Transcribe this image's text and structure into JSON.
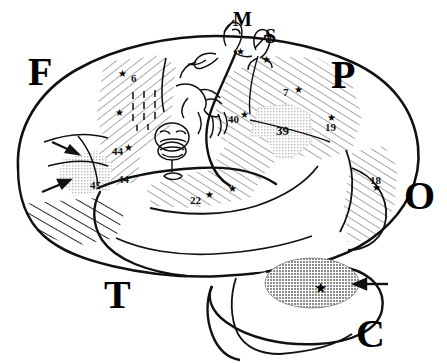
{
  "figure": {
    "kind": "brain-lateral-view-diagram"
  },
  "lobe_labels": [
    {
      "id": "frontal",
      "text": "F",
      "x": 28,
      "y": 52,
      "size": "big"
    },
    {
      "id": "parietal",
      "text": "P",
      "x": 331,
      "y": 55,
      "size": "big"
    },
    {
      "id": "occipital",
      "text": "O",
      "x": 404,
      "y": 176,
      "size": "big"
    },
    {
      "id": "temporal",
      "text": "T",
      "x": 104,
      "y": 275,
      "size": "big"
    },
    {
      "id": "cerebellum",
      "text": "C",
      "x": 356,
      "y": 314,
      "size": "big"
    },
    {
      "id": "motor",
      "text": "M",
      "x": 233,
      "y": 9,
      "size": "mid"
    },
    {
      "id": "sensory",
      "text": "S",
      "x": 265,
      "y": 26,
      "size": "mid"
    }
  ],
  "brodmann_areas": [
    {
      "id": "area-6",
      "label": "6",
      "x": 131,
      "y": 73,
      "big": false
    },
    {
      "id": "area-7",
      "label": "7",
      "x": 283,
      "y": 87,
      "big": false
    },
    {
      "id": "area-40",
      "label": "40",
      "x": 228,
      "y": 114,
      "big": false
    },
    {
      "id": "area-39",
      "label": "39",
      "x": 276,
      "y": 124,
      "big": true
    },
    {
      "id": "area-19",
      "label": "19",
      "x": 325,
      "y": 122,
      "big": false
    },
    {
      "id": "area-18",
      "label": "18",
      "x": 370,
      "y": 175,
      "big": false
    },
    {
      "id": "area-44",
      "label": "44",
      "x": 112,
      "y": 146,
      "big": false
    },
    {
      "id": "area-44b",
      "label": "44",
      "x": 118,
      "y": 174,
      "big": false
    },
    {
      "id": "area-45",
      "label": "45",
      "x": 90,
      "y": 180,
      "big": false
    },
    {
      "id": "area-22",
      "label": "22",
      "x": 190,
      "y": 195,
      "big": false
    }
  ],
  "stars": [
    {
      "id": "star-area-6-upper",
      "x": 118,
      "y": 69,
      "size": "sm"
    },
    {
      "id": "star-area-6-lower",
      "x": 115,
      "y": 108,
      "size": "sm"
    },
    {
      "id": "star-area-44",
      "x": 124,
      "y": 143,
      "size": "sm"
    },
    {
      "id": "star-area-22-left",
      "x": 205,
      "y": 190,
      "size": "sm"
    },
    {
      "id": "star-area-22-right",
      "x": 228,
      "y": 184,
      "size": "sm"
    },
    {
      "id": "star-area-40",
      "x": 240,
      "y": 110,
      "size": "sm"
    },
    {
      "id": "star-area-7",
      "x": 294,
      "y": 85,
      "size": "sm"
    },
    {
      "id": "star-area-19",
      "x": 327,
      "y": 113,
      "size": "sm"
    },
    {
      "id": "star-area-18",
      "x": 372,
      "y": 183,
      "size": "sm"
    },
    {
      "id": "star-cerebellum",
      "x": 314,
      "y": 281,
      "size": "lg"
    },
    {
      "id": "star-motor-top",
      "x": 236,
      "y": 47,
      "size": "sm"
    },
    {
      "id": "star-sensory-top",
      "x": 262,
      "y": 55,
      "size": "sm"
    }
  ],
  "shaded_regions": [
    {
      "id": "premotor-area-6",
      "pattern": "hatch-right",
      "label": "6"
    },
    {
      "id": "parietal-areas-7-40-19",
      "pattern": "hatch-left",
      "label": "7/40/19"
    },
    {
      "id": "angular-gyrus-area-39",
      "pattern": "stipple-light",
      "label": "39"
    },
    {
      "id": "superior-temporal-22",
      "pattern": "hatch-left",
      "label": "22"
    },
    {
      "id": "broca-area-44",
      "pattern": "hatch-right",
      "label": "44"
    },
    {
      "id": "area-45-region",
      "pattern": "stipple-light",
      "label": "45"
    },
    {
      "id": "occipital-area-18",
      "pattern": "hatch-left",
      "label": "18"
    },
    {
      "id": "orbital-frontal-band",
      "pattern": "hatch-bold",
      "label": ""
    },
    {
      "id": "cerebellar-focus",
      "pattern": "stipple-dark",
      "label": ""
    }
  ],
  "arrows": [
    {
      "id": "arrow-frontal-upper",
      "direction": "right-down"
    },
    {
      "id": "arrow-frontal-lower",
      "direction": "right-up"
    },
    {
      "id": "arrow-cerebellum",
      "direction": "left"
    }
  ],
  "tick_marks": {
    "id": "sma-tick-grid",
    "rows": 4,
    "cols": 3
  },
  "colors": {
    "ink": "#000000",
    "hatch": "#8a8a8a",
    "stipple_light": "#cfcfcf",
    "stipple_dark": "#9a9a9a",
    "background": "#ffffff"
  }
}
